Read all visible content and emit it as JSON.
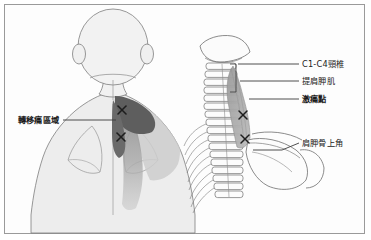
{
  "figure": {
    "border_color": "#9a9a9a",
    "background_color": "#fdfdfd"
  },
  "colors": {
    "skin_fill": "#ededed",
    "outline": "#7d7d7d",
    "pain_dark": "#5e5e5e",
    "pain_mid": "#9e9e9e",
    "pain_light": "#c8c8c8",
    "muscle_fill": "#a8a8a8",
    "bone_outline": "#6f6f6f",
    "leader_line": "#3b3b3b",
    "text": "#1b1b1b",
    "trigger_x": "#2b2b2b"
  },
  "left_panel": {
    "name": "posterior-body-view",
    "labels": [
      {
        "id": "referred-pain-area",
        "text": "轉移痛區域",
        "bold": true,
        "x": 18,
        "y": 116
      }
    ]
  },
  "right_panel": {
    "name": "cervical-spine-skeletal-view",
    "labels": [
      {
        "id": "cervical-vertebrae",
        "text": "C1-C4頸椎",
        "bold": false,
        "x": 302,
        "y": 60
      },
      {
        "id": "levator-scapulae-muscle",
        "text": "提肩胛肌",
        "bold": false,
        "x": 302,
        "y": 77
      },
      {
        "id": "trigger-point",
        "text": "激痛點",
        "bold": true,
        "x": 302,
        "y": 95
      },
      {
        "id": "superior-angle-of-scapula",
        "text": "肩胛骨上角",
        "bold": false,
        "x": 302,
        "y": 139
      }
    ]
  },
  "markers": {
    "trigger_points_body": [
      {
        "x": 122,
        "y": 110
      },
      {
        "x": 121,
        "y": 137
      }
    ],
    "trigger_points_skeleton": [
      {
        "x": 243,
        "y": 115
      },
      {
        "x": 245,
        "y": 139
      }
    ]
  }
}
